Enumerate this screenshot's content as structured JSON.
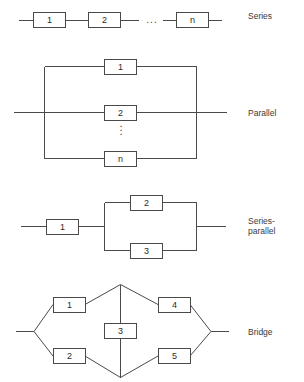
{
  "figure": {
    "line_color": "#4a4a4a",
    "text_color": "#3a3a3a",
    "background": "#ffffff"
  },
  "rows": [
    {
      "key": "series",
      "label": "Series",
      "label_x": 248,
      "label_y": 16,
      "blocks": [
        {
          "id": "s1",
          "text": "1",
          "x": 33,
          "y": 12,
          "w": 32,
          "h": 15
        },
        {
          "id": "s2",
          "text": "2",
          "x": 88,
          "y": 12,
          "w": 32,
          "h": 15
        },
        {
          "id": "sn",
          "text": "n",
          "x": 176,
          "y": 12,
          "w": 32,
          "h": 15
        }
      ],
      "ellipsis": {
        "text": "...",
        "x": 152,
        "y": 20
      }
    },
    {
      "key": "parallel",
      "label": "Parallel",
      "label_x": 248,
      "label_y": 116,
      "blocks": [
        {
          "id": "p1",
          "text": "1",
          "x": 104,
          "y": 59,
          "w": 32,
          "h": 15
        },
        {
          "id": "p2",
          "text": "2",
          "x": 104,
          "y": 105,
          "w": 32,
          "h": 15
        },
        {
          "id": "pn",
          "text": "n",
          "x": 104,
          "y": 150,
          "w": 32,
          "h": 15
        }
      ],
      "vertical_dots": {
        "x": 121,
        "y": 128
      }
    },
    {
      "key": "series-parallel",
      "label": "Series-\nparallel",
      "label_x": 248,
      "label_y": 218,
      "blocks": [
        {
          "id": "sp1",
          "text": "1",
          "x": 46,
          "y": 219,
          "w": 32,
          "h": 15
        },
        {
          "id": "sp2",
          "text": "2",
          "x": 130,
          "y": 195,
          "w": 32,
          "h": 15
        },
        {
          "id": "sp3",
          "text": "3",
          "x": 130,
          "y": 243,
          "w": 32,
          "h": 15
        }
      ]
    },
    {
      "key": "bridge",
      "label": "Bridge",
      "label_x": 248,
      "label_y": 327,
      "blocks": [
        {
          "id": "b1",
          "text": "1",
          "x": 53,
          "y": 297,
          "w": 32,
          "h": 15
        },
        {
          "id": "b2",
          "text": "2",
          "x": 53,
          "y": 348,
          "w": 32,
          "h": 15
        },
        {
          "id": "b3",
          "text": "3",
          "x": 104,
          "y": 323,
          "w": 32,
          "h": 15
        },
        {
          "id": "b4",
          "text": "4",
          "x": 158,
          "y": 297,
          "w": 32,
          "h": 15
        },
        {
          "id": "b5",
          "text": "5",
          "x": 158,
          "y": 348,
          "w": 32,
          "h": 15
        }
      ]
    }
  ]
}
